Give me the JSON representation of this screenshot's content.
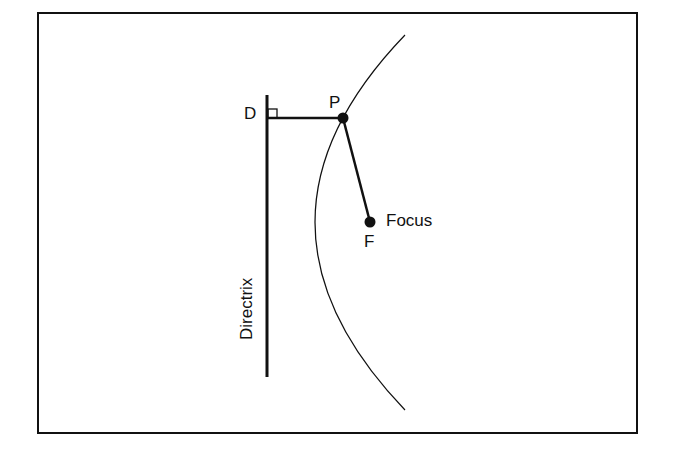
{
  "diagram": {
    "labels": {
      "D": "D",
      "P": "P",
      "F": "F",
      "focus": "Focus",
      "directrix": "Directrix"
    },
    "colors": {
      "stroke": "#111111",
      "background": "#ffffff"
    }
  }
}
